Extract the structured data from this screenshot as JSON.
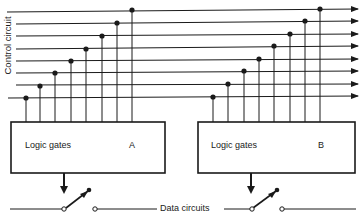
{
  "labels": {
    "control_circuit": "Control circuit",
    "data_circuits": "Data circuits"
  },
  "boxes": [
    {
      "id": "A",
      "title": "Logic gates",
      "tag": "A"
    },
    {
      "id": "B",
      "title": "Logic gates",
      "tag": "B"
    }
  ],
  "control_lines": {
    "count": 8
  },
  "colors": {
    "ink": "#1a1a1a",
    "background": "#ffffff"
  }
}
